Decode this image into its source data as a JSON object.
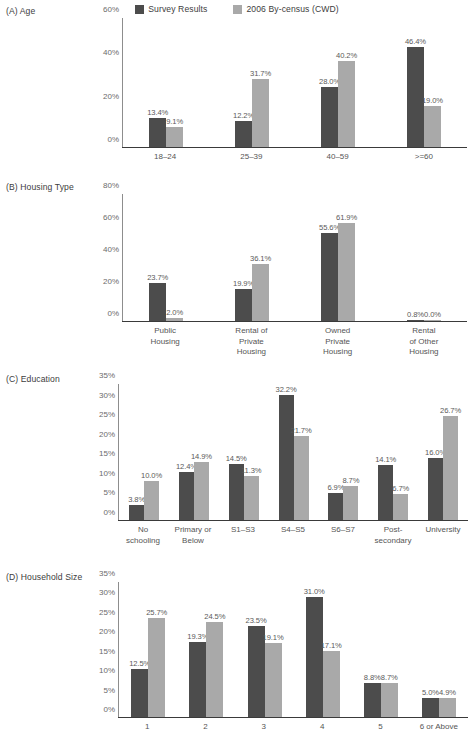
{
  "legend": {
    "items": [
      {
        "label": "Survey Results",
        "color": "#4c4c4c",
        "icon": "legend-swatch-dark"
      },
      {
        "label": "2006 By-census (CWD)",
        "color": "#a9a9a9",
        "icon": "legend-swatch-light"
      }
    ]
  },
  "chart_data": [
    {
      "type": "bar",
      "title": "(A) Age",
      "xlabel": "",
      "ylabel": "",
      "ylim": [
        0,
        60
      ],
      "yticks": [
        "0%",
        "20%",
        "40%",
        "60%"
      ],
      "ytick_values": [
        0,
        20,
        40,
        60
      ],
      "grid": false,
      "legend_position": "top-center",
      "categories": [
        "18–24",
        "25–39",
        "40–59",
        ">=60"
      ],
      "series": [
        {
          "name": "Survey Results",
          "values": [
            13.4,
            12.2,
            28.0,
            46.4
          ],
          "labels": [
            "13.4%",
            "12.2%",
            "28.0%",
            "46.4%"
          ]
        },
        {
          "name": "2006 By-census (CWD)",
          "values": [
            9.1,
            31.7,
            40.2,
            19.0
          ],
          "labels": [
            "9.1%",
            "31.7%",
            "40.2%",
            "19.0%"
          ]
        }
      ]
    },
    {
      "type": "bar",
      "title": "(B) Housing Type",
      "xlabel": "",
      "ylabel": "",
      "ylim": [
        0,
        80
      ],
      "yticks": [
        "0%",
        "20%",
        "40%",
        "60%",
        "80%"
      ],
      "ytick_values": [
        0,
        20,
        40,
        60,
        80
      ],
      "grid": false,
      "legend_position": "top-center",
      "categories": [
        "Public\nHousing",
        "Rental of\nPrivate\nHousing",
        "Owned\nPrivate\nHousing",
        "Rental\nof Other\nHousing"
      ],
      "series": [
        {
          "name": "Survey Results",
          "values": [
            23.7,
            19.9,
            55.6,
            0.8
          ],
          "labels": [
            "23.7%",
            "19.9%",
            "55.6%",
            "0.8%"
          ]
        },
        {
          "name": "2006 By-census (CWD)",
          "values": [
            2.0,
            36.1,
            61.9,
            0.0
          ],
          "labels": [
            "2.0%",
            "36.1%",
            "61.9%",
            "0.0%"
          ]
        }
      ]
    },
    {
      "type": "bar",
      "title": "(C) Education",
      "xlabel": "",
      "ylabel": "",
      "ylim": [
        0,
        35
      ],
      "yticks": [
        "0%",
        "5%",
        "10%",
        "15%",
        "20%",
        "25%",
        "30%",
        "35%"
      ],
      "ytick_values": [
        0,
        5,
        10,
        15,
        20,
        25,
        30,
        35
      ],
      "grid": false,
      "legend_position": "top-center",
      "categories": [
        "No\nschooling",
        "Primary or\nBelow",
        "S1–S3",
        "S4–S5",
        "S6–S7",
        "Post-\nsecondary",
        "University"
      ],
      "series": [
        {
          "name": "Survey Results",
          "values": [
            3.8,
            12.4,
            14.5,
            32.2,
            6.9,
            14.1,
            16.0
          ],
          "labels": [
            "3.8%",
            "12.4%",
            "14.5%",
            "32.2%",
            "6.9%",
            "14.1%",
            "16.0%"
          ]
        },
        {
          "name": "2006 By-census (CWD)",
          "values": [
            10.0,
            14.9,
            11.3,
            21.7,
            8.7,
            6.7,
            26.7
          ],
          "labels": [
            "10.0%",
            "14.9%",
            "11.3%",
            "21.7%",
            "8.7%",
            "6.7%",
            "26.7%"
          ]
        }
      ]
    },
    {
      "type": "bar",
      "title": "(D) Household Size",
      "xlabel": "",
      "ylabel": "",
      "ylim": [
        0,
        35
      ],
      "yticks": [
        "0%",
        "5%",
        "10%",
        "15%",
        "20%",
        "25%",
        "30%",
        "35%"
      ],
      "ytick_values": [
        0,
        5,
        10,
        15,
        20,
        25,
        30,
        35
      ],
      "grid": false,
      "legend_position": "top-center",
      "categories": [
        "1",
        "2",
        "3",
        "4",
        "5",
        "6 or Above"
      ],
      "series": [
        {
          "name": "Survey Results",
          "values": [
            12.5,
            19.3,
            23.5,
            31.0,
            8.8,
            5.0
          ],
          "labels": [
            "12.5%",
            "19.3%",
            "23.5%",
            "31.0%",
            "8.8%",
            "5.0%"
          ]
        },
        {
          "name": "2006 By-census (CWD)",
          "values": [
            25.7,
            24.5,
            19.1,
            17.1,
            8.7,
            4.9
          ],
          "labels": [
            "25.7%",
            "24.5%",
            "19.1%",
            "17.1%",
            "8.7%",
            "4.9%"
          ]
        }
      ]
    }
  ],
  "layout": {
    "panels": [
      {
        "top": 6,
        "plot_left": 122,
        "plot_top": 18,
        "plot_w": 345,
        "plot_h": 130,
        "xlab_top": 152,
        "bar_w": 17,
        "label_fs": 7.6
      },
      {
        "top": 182,
        "plot_left": 122,
        "plot_top": 194,
        "plot_w": 345,
        "plot_h": 128,
        "xlab_top": 326,
        "bar_w": 17,
        "label_fs": 7.6
      },
      {
        "top": 374,
        "plot_left": 118,
        "plot_top": 384,
        "plot_w": 350,
        "plot_h": 137,
        "xlab_top": 525,
        "bar_w": 15,
        "label_fs": 7.6
      },
      {
        "top": 572,
        "plot_left": 118,
        "plot_top": 582,
        "plot_w": 350,
        "plot_h": 136,
        "xlab_top": 722,
        "bar_w": 17,
        "label_fs": 7.6
      }
    ]
  }
}
